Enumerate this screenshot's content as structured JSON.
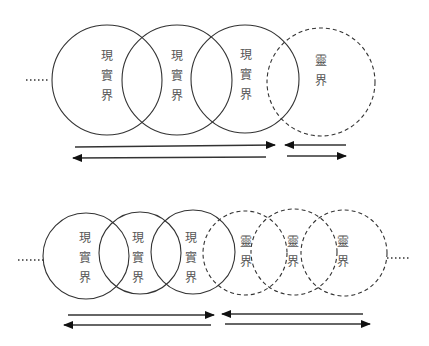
{
  "colors": {
    "stroke": "#333333",
    "text": "#555555",
    "background": "#ffffff"
  },
  "top_row": {
    "leading_ellipsis": "……",
    "circles": [
      {
        "style": "solid",
        "label_chars": [
          "現",
          "實",
          "界"
        ]
      },
      {
        "style": "solid",
        "label_chars": [
          "現",
          "實",
          "界"
        ]
      },
      {
        "style": "solid",
        "label_chars": [
          "現",
          "實",
          "界"
        ]
      },
      {
        "style": "dashed",
        "label_chars": [
          "靈",
          "界"
        ]
      }
    ],
    "arrows": [
      {
        "direction": "right",
        "span": "real-world"
      },
      {
        "direction": "left",
        "span": "real-world"
      },
      {
        "direction": "left",
        "span": "spirit-world"
      },
      {
        "direction": "right",
        "span": "spirit-world"
      }
    ]
  },
  "bottom_row": {
    "leading_ellipsis": "……",
    "trailing_ellipsis": "……",
    "circles": [
      {
        "style": "solid",
        "label_chars": [
          "現",
          "實",
          "界"
        ]
      },
      {
        "style": "solid",
        "label_chars": [
          "現",
          "實",
          "界"
        ]
      },
      {
        "style": "solid",
        "label_chars": [
          "現",
          "實",
          "界"
        ]
      },
      {
        "style": "dashed",
        "label_chars": [
          "靈",
          "界"
        ]
      },
      {
        "style": "dashed",
        "label_chars": [
          "靈",
          "界"
        ]
      },
      {
        "style": "dashed",
        "label_chars": [
          "靈",
          "界"
        ]
      }
    ],
    "arrows": [
      {
        "direction": "right",
        "span": "real-world"
      },
      {
        "direction": "left",
        "span": "real-world"
      },
      {
        "direction": "left",
        "span": "spirit-world"
      },
      {
        "direction": "right",
        "span": "spirit-world"
      }
    ]
  }
}
